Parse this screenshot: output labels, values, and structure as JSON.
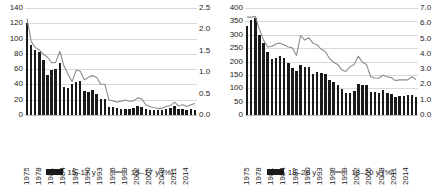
{
  "figure": {
    "background": "#ffffff",
    "bar_color": "#1a1a1a",
    "line_color": "#8c8c8c",
    "grid_color": "#d9d9d9"
  },
  "chart_data": [
    {
      "type": "bar",
      "title": "",
      "subtitle": "",
      "xlabel": "",
      "ylabel": "",
      "grid": true,
      "legend_position": "bottom",
      "x": [
        1975,
        1976,
        1977,
        1978,
        1979,
        1980,
        1981,
        1982,
        1983,
        1984,
        1985,
        1986,
        1987,
        1988,
        1989,
        1990,
        1991,
        1992,
        1993,
        1994,
        1995,
        1996,
        1997,
        1998,
        1999,
        2000,
        2001,
        2002,
        2003,
        2004,
        2005,
        2006,
        2007,
        2008,
        2009,
        2010,
        2011,
        2012,
        2013,
        2014,
        2015,
        2016
      ],
      "xtick_labels": [
        "1975",
        "1978",
        "1981",
        "1984",
        "1987",
        "1990",
        "1993",
        "1996",
        "1999",
        "2002",
        "2005",
        "2008",
        "2011",
        "2014"
      ],
      "ylim": [
        0,
        140
      ],
      "yticks": [
        "0",
        "20",
        "40",
        "60",
        "80",
        "100",
        "120",
        "140"
      ],
      "y2lim": [
        0.0,
        2.5
      ],
      "y2ticks": [
        "0.0",
        "0.5",
        "1.0",
        "1.5",
        "2.0",
        "2.5"
      ],
      "series": [
        {
          "name": "15–17 y",
          "kind": "bar",
          "axis": "left",
          "color": "#1a1a1a",
          "values": [
            120,
            92,
            85,
            82,
            72,
            52,
            59,
            60,
            68,
            37,
            36,
            40,
            43,
            45,
            31,
            30,
            33,
            28,
            21,
            21,
            11,
            10,
            9,
            8,
            8,
            8,
            9,
            12,
            10,
            8,
            7,
            6,
            6,
            6,
            8,
            9,
            12,
            8,
            8,
            7,
            8,
            6
          ]
        },
        {
          "name": "15–17 y (%)",
          "kind": "line",
          "axis": "right",
          "color": "#8c8c8c",
          "values": [
            2.25,
            1.72,
            1.58,
            1.52,
            1.42,
            1.35,
            1.22,
            1.23,
            1.49,
            1.15,
            0.95,
            0.78,
            1.05,
            1.02,
            0.82,
            0.88,
            0.92,
            0.88,
            0.72,
            0.72,
            0.35,
            0.33,
            0.3,
            0.32,
            0.35,
            0.32,
            0.33,
            0.4,
            0.38,
            0.24,
            0.2,
            0.17,
            0.15,
            0.16,
            0.2,
            0.22,
            0.3,
            0.21,
            0.24,
            0.2,
            0.24,
            0.27
          ]
        }
      ]
    },
    {
      "type": "bar",
      "title": "",
      "subtitle": "",
      "xlabel": "",
      "ylabel": "",
      "grid": true,
      "legend_position": "bottom",
      "x": [
        1975,
        1976,
        1977,
        1978,
        1979,
        1980,
        1981,
        1982,
        1983,
        1984,
        1985,
        1986,
        1987,
        1988,
        1989,
        1990,
        1991,
        1992,
        1993,
        1994,
        1995,
        1996,
        1997,
        1998,
        1999,
        2000,
        2001,
        2002,
        2003,
        2004,
        2005,
        2006,
        2007,
        2008,
        2009,
        2010,
        2011,
        2012,
        2013,
        2014,
        2015,
        2016
      ],
      "xtick_labels": [
        "1975",
        "1978",
        "1981",
        "1984",
        "1987",
        "1990",
        "1993",
        "1996",
        "1999",
        "2002",
        "2005",
        "2008",
        "2011",
        "2014"
      ],
      "ylim": [
        0,
        400
      ],
      "yticks": [
        "0",
        "50",
        "100",
        "150",
        "200",
        "250",
        "300",
        "350",
        "400"
      ],
      "y2lim": [
        0.0,
        7.0
      ],
      "y2ticks": [
        "0.0",
        "1.0",
        "2.0",
        "3.0",
        "4.0",
        "5.0",
        "6.0",
        "7.0"
      ],
      "series": [
        {
          "name": "18–20 y",
          "kind": "bar",
          "axis": "left",
          "color": "#1a1a1a",
          "values": [
            332,
            355,
            363,
            300,
            268,
            235,
            210,
            215,
            222,
            215,
            196,
            177,
            163,
            188,
            178,
            180,
            152,
            160,
            158,
            152,
            130,
            124,
            112,
            98,
            84,
            84,
            90,
            115,
            114,
            112,
            86,
            86,
            83,
            92,
            84,
            78,
            68,
            72,
            70,
            74,
            76,
            68
          ]
        },
        {
          "name": "18–20 y (%)",
          "kind": "line",
          "axis": "right",
          "color": "#8c8c8c",
          "values": [
            6.4,
            6.4,
            6.45,
            5.6,
            4.9,
            4.45,
            4.5,
            4.65,
            4.7,
            4.6,
            4.45,
            4.4,
            3.9,
            5.2,
            4.9,
            5.05,
            4.7,
            4.6,
            4.3,
            4.15,
            3.7,
            3.45,
            3.3,
            2.95,
            2.85,
            3.15,
            3.3,
            3.85,
            3.45,
            3.3,
            2.5,
            2.42,
            2.4,
            2.6,
            2.5,
            2.45,
            2.25,
            2.3,
            2.3,
            2.3,
            2.5,
            2.32
          ]
        }
      ]
    }
  ],
  "panels": [
    {
      "id": "panel-15-17",
      "legend": [
        {
          "label": "15–17 y",
          "swatch": "bar-swatch"
        },
        {
          "label": "15–17 y (%)",
          "swatch": "line-swatch"
        }
      ]
    },
    {
      "id": "panel-18-20",
      "legend": [
        {
          "label": "18–20 y",
          "swatch": "bar-swatch"
        },
        {
          "label": "18–20 y (%)",
          "swatch": "line-swatch"
        }
      ]
    }
  ]
}
